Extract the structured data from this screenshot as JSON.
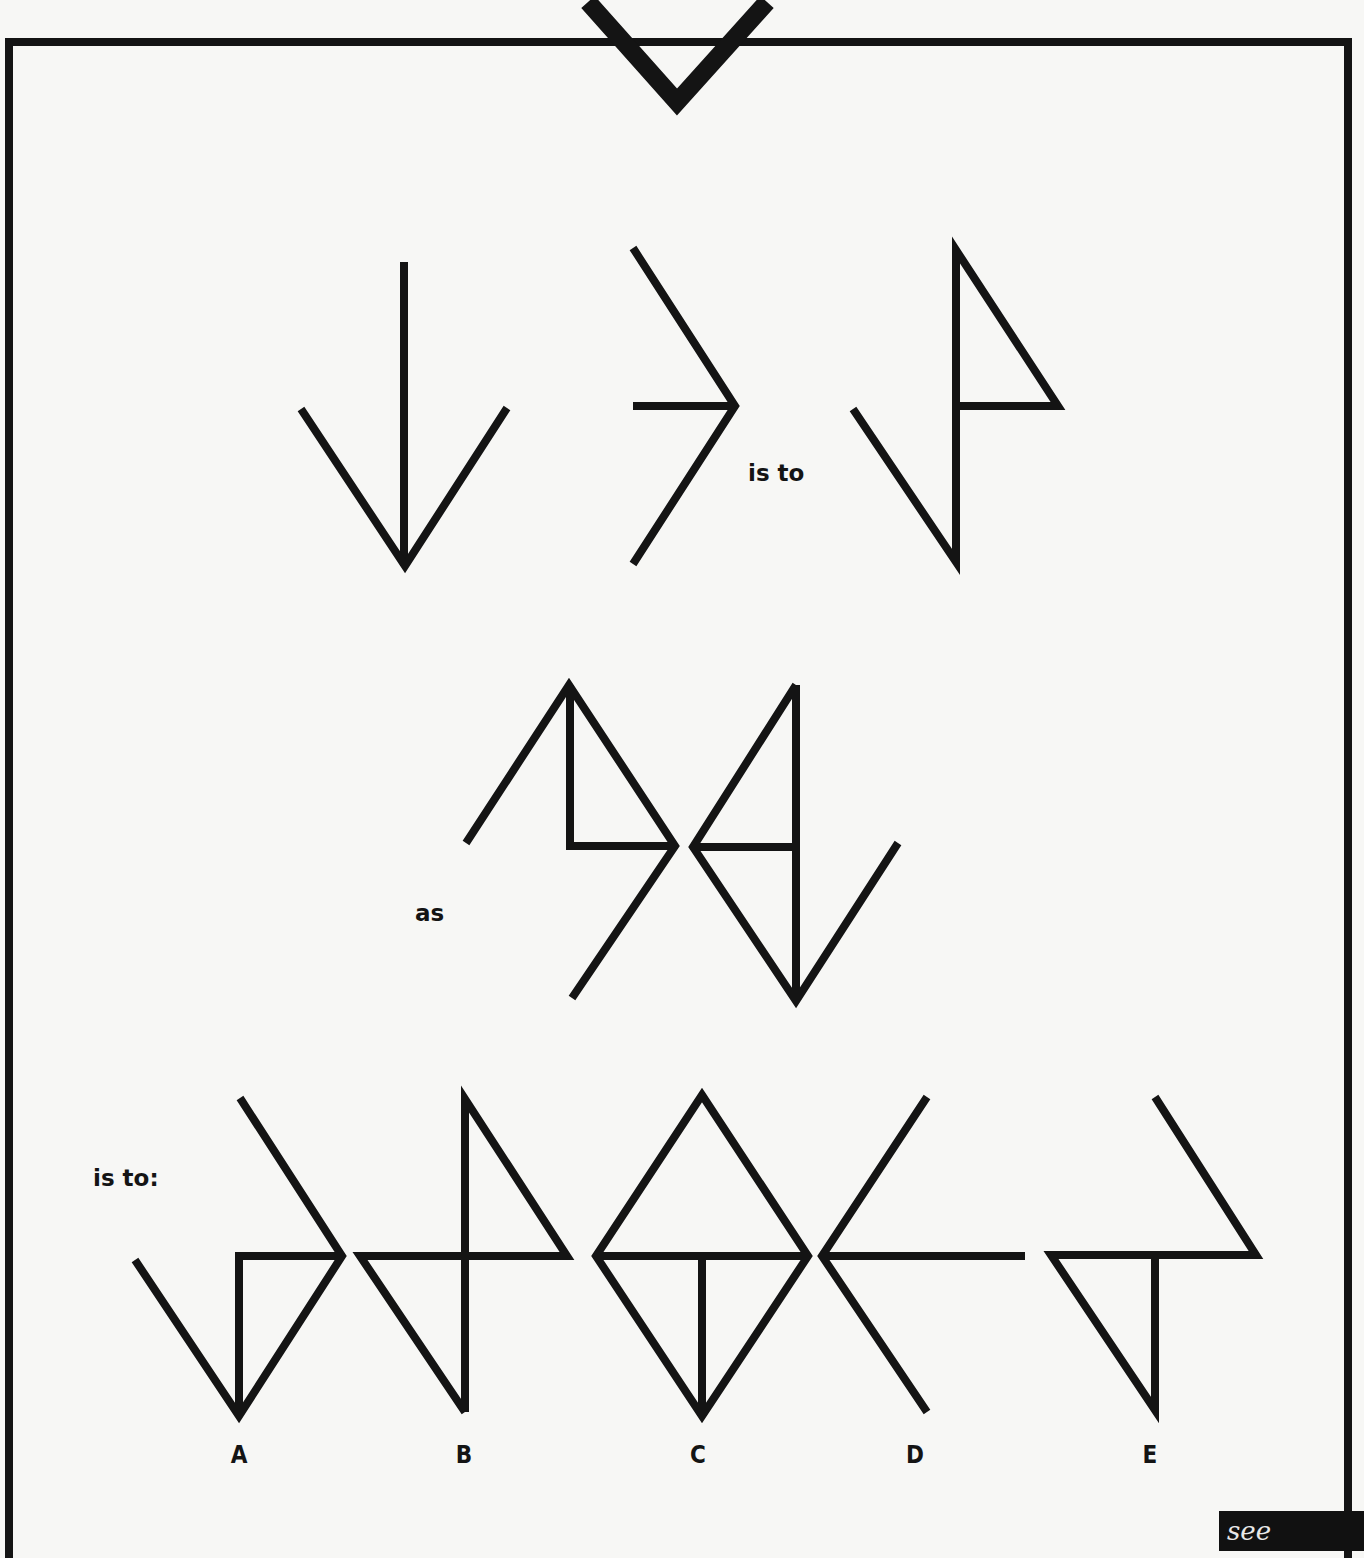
{
  "puzzle": {
    "connector_1": "is to",
    "connector_2": "as",
    "connector_3": "is to:",
    "options": [
      {
        "letter": "A"
      },
      {
        "letter": "B"
      },
      {
        "letter": "C"
      },
      {
        "letter": "D"
      },
      {
        "letter": "E"
      }
    ],
    "see_answer_label": "see answer"
  },
  "colors": {
    "ink": "#141414",
    "background": "#f7f7f5"
  }
}
